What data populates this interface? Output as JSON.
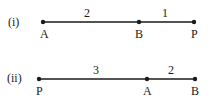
{
  "diagrams": [
    {
      "label": "(i)",
      "points": [
        {
          "name": "A",
          "x": 43
        },
        {
          "name": "B",
          "x": 139
        },
        {
          "name": "P",
          "x": 194
        }
      ],
      "segments": [
        {
          "from": "A",
          "to": "B",
          "ratio": "2"
        },
        {
          "from": "B",
          "to": "P",
          "ratio": "1"
        }
      ]
    },
    {
      "label": "(ii)",
      "points": [
        {
          "name": "P",
          "x": 39
        },
        {
          "name": "A",
          "x": 147
        },
        {
          "name": "B",
          "x": 195
        }
      ],
      "segments": [
        {
          "from": "P",
          "to": "A",
          "ratio": "3"
        },
        {
          "from": "A",
          "to": "B",
          "ratio": "2"
        }
      ]
    }
  ],
  "colors": {
    "line": "#1a1a1a",
    "background": "#ffffff"
  }
}
